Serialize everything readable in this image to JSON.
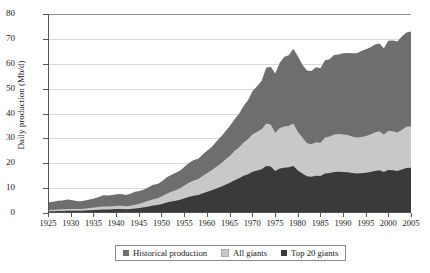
{
  "chart_data": {
    "type": "area",
    "title": "",
    "xlabel": "",
    "ylabel": "Daily production (Mb/d)",
    "xlim": [
      1925,
      2005
    ],
    "ylim": [
      0,
      80
    ],
    "yticks": [
      0,
      10,
      20,
      30,
      40,
      50,
      60,
      70,
      80
    ],
    "xticks": [
      1925,
      1930,
      1935,
      1940,
      1945,
      1950,
      1955,
      1960,
      1965,
      1970,
      1975,
      1980,
      1985,
      1990,
      1995,
      2000,
      2005
    ],
    "grid": true,
    "stacked": true,
    "legend_position": "bottom",
    "legend": [
      "Historical production",
      "All giants",
      "Top 20 giants"
    ],
    "colors": {
      "historical_production": "#6e6e6e",
      "all_giants": "#c8c8c8",
      "top_20_giants": "#3a3a3a",
      "gridline": "#d9d9d9",
      "axis": "#555555",
      "background": "#ffffff"
    },
    "x": [
      1925,
      1926,
      1927,
      1928,
      1929,
      1930,
      1931,
      1932,
      1933,
      1934,
      1935,
      1936,
      1937,
      1938,
      1939,
      1940,
      1941,
      1942,
      1943,
      1944,
      1945,
      1946,
      1947,
      1948,
      1949,
      1950,
      1951,
      1952,
      1953,
      1954,
      1955,
      1956,
      1957,
      1958,
      1959,
      1960,
      1961,
      1962,
      1963,
      1964,
      1965,
      1966,
      1967,
      1968,
      1969,
      1970,
      1971,
      1972,
      1973,
      1974,
      1975,
      1976,
      1977,
      1978,
      1979,
      1980,
      1981,
      1982,
      1983,
      1984,
      1985,
      1986,
      1987,
      1988,
      1989,
      1990,
      1991,
      1992,
      1993,
      1994,
      1995,
      1996,
      1997,
      1998,
      1999,
      2000,
      2001,
      2002,
      2003,
      2004,
      2005
    ],
    "series": [
      {
        "name": "Top 20 giants",
        "values": [
          0.3,
          0.3,
          0.4,
          0.4,
          0.5,
          0.5,
          0.5,
          0.5,
          0.6,
          0.7,
          0.8,
          0.9,
          1.0,
          1.0,
          1.1,
          1.2,
          1.2,
          1.1,
          1.2,
          1.4,
          1.6,
          1.9,
          2.2,
          2.6,
          2.8,
          3.2,
          3.8,
          4.2,
          4.5,
          4.9,
          5.6,
          6.2,
          6.6,
          6.9,
          7.6,
          8.2,
          8.8,
          9.5,
          10.2,
          11.0,
          11.8,
          12.8,
          13.6,
          14.6,
          15.3,
          16.3,
          16.8,
          17.3,
          18.6,
          18.4,
          16.6,
          17.6,
          17.9,
          18.1,
          18.6,
          16.8,
          15.6,
          14.4,
          14.2,
          14.6,
          14.5,
          15.6,
          15.8,
          16.2,
          16.3,
          16.2,
          16.1,
          15.8,
          15.6,
          15.7,
          15.9,
          16.2,
          16.6,
          16.9,
          16.2,
          17.0,
          16.9,
          16.6,
          17.2,
          17.8,
          17.9
        ]
      },
      {
        "name": "All giants",
        "values": [
          0.8,
          0.9,
          1.0,
          1.1,
          1.2,
          1.2,
          1.2,
          1.2,
          1.4,
          1.6,
          1.8,
          2.0,
          2.2,
          2.2,
          2.3,
          2.5,
          2.5,
          2.3,
          2.5,
          2.9,
          3.3,
          3.9,
          4.5,
          5.2,
          5.6,
          6.4,
          7.4,
          8.2,
          8.8,
          9.6,
          10.8,
          11.9,
          12.7,
          13.3,
          14.6,
          15.8,
          17.0,
          18.3,
          19.6,
          21.2,
          22.7,
          24.6,
          26.2,
          28.1,
          29.5,
          31.4,
          32.4,
          33.4,
          35.8,
          35.4,
          32.0,
          33.9,
          34.5,
          34.9,
          35.8,
          32.4,
          30.1,
          27.8,
          27.4,
          28.2,
          28.0,
          30.1,
          30.5,
          31.3,
          31.5,
          31.3,
          31.1,
          30.5,
          30.1,
          30.3,
          30.7,
          31.3,
          32.1,
          32.6,
          31.3,
          32.8,
          32.6,
          32.1,
          33.2,
          34.4,
          34.6
        ]
      },
      {
        "name": "Historical production",
        "values": [
          3.9,
          4.1,
          4.5,
          4.6,
          5.0,
          4.8,
          4.4,
          4.3,
          4.6,
          5.0,
          5.5,
          6.1,
          6.8,
          6.7,
          6.9,
          7.2,
          7.3,
          6.9,
          7.4,
          8.2,
          8.5,
          9.1,
          10.0,
          11.0,
          11.3,
          12.4,
          14.0,
          15.0,
          15.9,
          16.8,
          18.4,
          19.9,
          21.0,
          21.5,
          23.3,
          24.8,
          26.4,
          28.5,
          30.4,
          32.6,
          34.8,
          37.5,
          39.7,
          42.8,
          45.3,
          48.9,
          50.8,
          53.0,
          58.3,
          58.7,
          56.0,
          60.3,
          62.7,
          63.3,
          66.0,
          62.9,
          59.5,
          57.2,
          57.0,
          58.5,
          58.1,
          61.3,
          61.7,
          63.4,
          63.6,
          64.1,
          64.2,
          64.1,
          64.1,
          65.0,
          65.8,
          66.5,
          67.7,
          68.1,
          66.2,
          69.2,
          69.3,
          68.9,
          71.0,
          72.5,
          72.9
        ]
      }
    ]
  },
  "legend_entries": [
    {
      "label": "Historical production",
      "color": "#6e6e6e"
    },
    {
      "label": "All giants",
      "color": "#c8c8c8"
    },
    {
      "label": "Top 20 giants",
      "color": "#3a3a3a"
    }
  ]
}
